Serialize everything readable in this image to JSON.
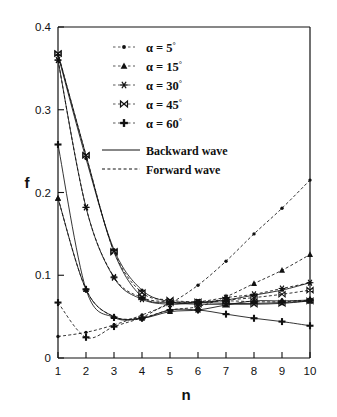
{
  "chart_data": {
    "type": "line",
    "title": "",
    "xlabel": "n",
    "ylabel": "f",
    "xlim": [
      1,
      10
    ],
    "ylim": [
      0,
      0.4
    ],
    "xticks": [
      1,
      2,
      3,
      4,
      5,
      6,
      7,
      8,
      9,
      10
    ],
    "xtick_labels": [
      "1",
      "2",
      "3",
      "4",
      "5",
      "6",
      "7",
      "8",
      "9",
      "10"
    ],
    "yticks": [
      0,
      0.1,
      0.2,
      0.3,
      0.4
    ],
    "ytick_labels": [
      "0",
      "0.1",
      "0.2",
      "0.3",
      "0.4"
    ],
    "grid": false,
    "legend_position": "upper-center",
    "x": [
      1,
      2,
      3,
      4,
      5,
      6,
      7,
      8,
      9,
      10
    ],
    "series": [
      {
        "name": "alpha = 5 deg, backward wave",
        "alpha_deg": 5,
        "wave": "Backward wave",
        "linestyle": "solid",
        "marker": "dot",
        "values": [
          0.366,
          0.241,
          0.131,
          0.082,
          0.068,
          0.067,
          0.07,
          0.076,
          0.082,
          0.091
        ]
      },
      {
        "name": "alpha = 5 deg, forward wave",
        "alpha_deg": 5,
        "wave": "Forward wave",
        "linestyle": "dashed",
        "marker": "dot",
        "values": [
          0.026,
          0.031,
          0.04,
          0.052,
          0.066,
          0.088,
          0.117,
          0.15,
          0.181,
          0.215
        ]
      },
      {
        "name": "alpha = 15 deg, backward wave",
        "alpha_deg": 15,
        "wave": "Backward wave",
        "linestyle": "solid",
        "marker": "triangle",
        "values": [
          0.193,
          0.083,
          0.05,
          0.048,
          0.056,
          0.058,
          0.064,
          0.069,
          0.069,
          0.07
        ]
      },
      {
        "name": "alpha = 15 deg, forward wave",
        "alpha_deg": 15,
        "wave": "Forward wave",
        "linestyle": "dashed",
        "marker": "triangle",
        "values": [
          0.193,
          0.083,
          0.05,
          0.049,
          0.058,
          0.062,
          0.074,
          0.09,
          0.106,
          0.125
        ]
      },
      {
        "name": "alpha = 30 deg, backward wave",
        "alpha_deg": 30,
        "wave": "Backward wave",
        "linestyle": "solid",
        "marker": "asterisk",
        "values": [
          0.36,
          0.182,
          0.097,
          0.071,
          0.065,
          0.067,
          0.066,
          0.066,
          0.067,
          0.069
        ]
      },
      {
        "name": "alpha = 30 deg, forward wave",
        "alpha_deg": 30,
        "wave": "Forward wave",
        "linestyle": "dashed",
        "marker": "asterisk",
        "values": [
          0.36,
          0.182,
          0.098,
          0.073,
          0.068,
          0.068,
          0.073,
          0.077,
          0.084,
          0.091
        ]
      },
      {
        "name": "alpha = 45 deg, backward wave",
        "alpha_deg": 45,
        "wave": "Backward wave",
        "linestyle": "solid",
        "marker": "bowtie",
        "values": [
          0.368,
          0.245,
          0.128,
          0.074,
          0.067,
          0.065,
          0.065,
          0.065,
          0.066,
          0.069
        ]
      },
      {
        "name": "alpha = 45 deg, forward wave",
        "alpha_deg": 45,
        "wave": "Forward wave",
        "linestyle": "dashed",
        "marker": "bowtie",
        "values": [
          0.368,
          0.245,
          0.129,
          0.079,
          0.07,
          0.068,
          0.07,
          0.073,
          0.077,
          0.082
        ]
      },
      {
        "name": "alpha = 60 deg, backward wave",
        "alpha_deg": 60,
        "wave": "Backward wave",
        "linestyle": "solid",
        "marker": "plus",
        "values": [
          0.258,
          0.083,
          0.049,
          0.048,
          0.058,
          0.058,
          0.053,
          0.048,
          0.044,
          0.039
        ]
      },
      {
        "name": "alpha = 60 deg, forward wave",
        "alpha_deg": 60,
        "wave": "Forward wave",
        "linestyle": "dashed",
        "marker": "plus",
        "values": [
          0.067,
          0.025,
          0.038,
          0.049,
          0.066,
          0.067,
          0.069,
          0.068,
          0.068,
          0.07
        ]
      }
    ],
    "legend": [
      {
        "marker": "dot",
        "label_alpha": "α = 5",
        "label_deg": "°"
      },
      {
        "marker": "triangle",
        "label_alpha": "α = 15",
        "label_deg": "°"
      },
      {
        "marker": "asterisk",
        "label_alpha": "α = 30",
        "label_deg": "°"
      },
      {
        "marker": "bowtie",
        "label_alpha": "α = 45",
        "label_deg": "°"
      },
      {
        "marker": "plus",
        "label_alpha": "α = 60",
        "label_deg": "°"
      }
    ],
    "legend_lines": [
      {
        "style": "solid",
        "label": "Backward wave"
      },
      {
        "style": "dashed",
        "label": "Forward wave"
      }
    ],
    "colors": {
      "ink": "#111111",
      "background": "#ffffff"
    }
  }
}
